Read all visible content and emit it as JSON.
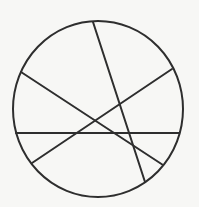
{
  "diagram": {
    "background": "#f7f7f5",
    "stroke_color": "#2e2e2e",
    "circle": {
      "cx": 98,
      "cy": 109,
      "rx": 85,
      "ry": 88
    },
    "chords": [
      {
        "id": "steep",
        "x1": 93,
        "y1": 22,
        "x2": 145,
        "y2": 182
      },
      {
        "id": "descending",
        "x1": 21,
        "y1": 72,
        "x2": 163,
        "y2": 165
      },
      {
        "id": "ascending",
        "x1": 32,
        "y1": 163,
        "x2": 172,
        "y2": 69
      },
      {
        "id": "horizontal",
        "x1": 16,
        "y1": 133,
        "x2": 179,
        "y2": 133
      }
    ]
  }
}
